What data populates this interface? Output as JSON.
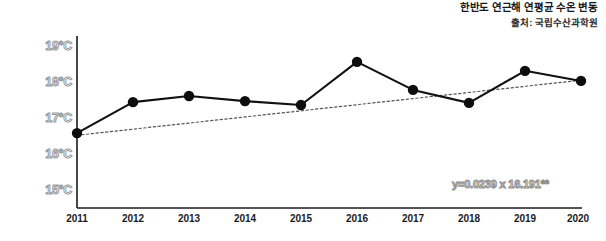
{
  "header": {
    "title": "한반도 연근해 연평균 수온 변동",
    "source": "출처: 국립수산과학원"
  },
  "annotation": {
    "equation": "y=0.0239 x 16.191**"
  },
  "colors": {
    "series_line": "#111111",
    "marker": "#0d0d0d",
    "trend_line": "#555555",
    "axis": "#1a1a1a",
    "ytick_text": "#9a9a9a",
    "xtick_text": "#1b1b1b",
    "background": "#ffffff"
  },
  "chart_data": {
    "type": "line",
    "title": "한반도 연근해 연평균 수온 변동",
    "subtitle": "출처: 국립수산과학원",
    "xlabel": "",
    "ylabel": "",
    "categories": [
      "2011",
      "2012",
      "2013",
      "2014",
      "2015",
      "2016",
      "2017",
      "2018",
      "2019",
      "2020"
    ],
    "x": [
      2011,
      2012,
      2013,
      2014,
      2015,
      2016,
      2017,
      2018,
      2019,
      2020
    ],
    "series": [
      {
        "name": "연평균 수온",
        "style": "solid-with-markers",
        "values": [
          16.58,
          17.44,
          17.61,
          17.47,
          17.36,
          18.56,
          17.78,
          17.42,
          18.31,
          18.03
        ]
      },
      {
        "name": "추세선",
        "style": "dotted",
        "values": [
          16.52,
          16.69,
          16.86,
          17.03,
          17.2,
          17.37,
          17.54,
          17.71,
          17.88,
          18.05
        ]
      }
    ],
    "ylim": [
      14.5,
      19.4
    ],
    "yticks": [
      15,
      16,
      17,
      18,
      19
    ],
    "ytick_labels": [
      "15°C",
      "16°C",
      "17°C",
      "18°C",
      "19°C"
    ],
    "xtick_labels": [
      "2011",
      "2012",
      "2013",
      "2014",
      "2015",
      "2016",
      "2017",
      "2018",
      "2019",
      "2020"
    ],
    "grid": false,
    "legend": "none",
    "annotations": [
      "y=0.0239 x 16.191**"
    ],
    "units": "°C"
  }
}
